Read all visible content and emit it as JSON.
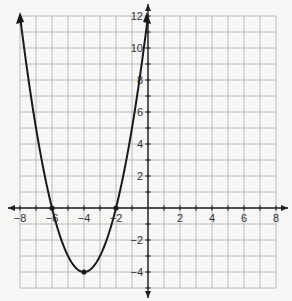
{
  "chart_data": {
    "type": "line",
    "title": "",
    "xlabel": "",
    "ylabel": "",
    "function": "y = (x + 4)^2 - 4",
    "xlim": [
      -8,
      8
    ],
    "ylim": [
      -5,
      12
    ],
    "grid": true,
    "x_ticks": [
      -8,
      -6,
      -4,
      -2,
      2,
      4,
      6,
      8
    ],
    "y_ticks": [
      -4,
      -2,
      2,
      4,
      6,
      8,
      10,
      12
    ],
    "x_tick_labels": [
      "−8",
      "−6",
      "−4",
      "−2",
      "2",
      "4",
      "6",
      "8"
    ],
    "y_tick_labels": [
      "−4",
      "−2",
      "2",
      "4",
      "6",
      "8",
      "10",
      "12"
    ],
    "series": [
      {
        "name": "parabola",
        "x": [
          -8,
          -7,
          -6,
          -5,
          -4,
          -3,
          -2,
          -1,
          0
        ],
        "y": [
          12,
          5,
          0,
          -3,
          -4,
          -3,
          0,
          5,
          12
        ]
      }
    ],
    "marked_points": [
      {
        "x": -6,
        "y": 0,
        "label": "x-intercept"
      },
      {
        "x": -2,
        "y": 0,
        "label": "x-intercept"
      },
      {
        "x": -4,
        "y": -4,
        "label": "vertex"
      }
    ]
  },
  "colors": {
    "grid": "#b8b8b8",
    "axis": "#222222",
    "curve": "#1a1a1a",
    "background": "#f7f7f5"
  }
}
